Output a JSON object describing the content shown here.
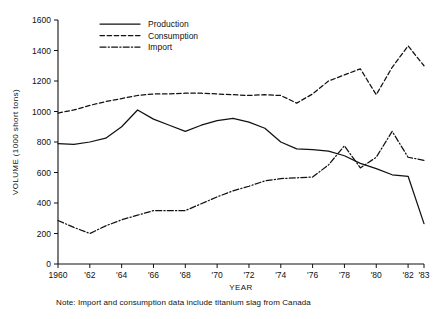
{
  "chart_data": {
    "type": "line",
    "title": "",
    "xlabel": "YEAR",
    "ylabel": "VOLUME (1000 short tons)",
    "xlim": [
      1960,
      1983
    ],
    "ylim": [
      0,
      1600
    ],
    "grid": false,
    "legend_position": "top-left-inside",
    "y_ticks": [
      0,
      200,
      400,
      600,
      800,
      1000,
      1200,
      1400,
      1600
    ],
    "y_tick_labels": [
      "0",
      "200",
      "400",
      "600",
      "800",
      "1000",
      "1200",
      "1400",
      "1600"
    ],
    "x_ticks": [
      1960,
      1962,
      1964,
      1966,
      1968,
      1970,
      1972,
      1974,
      1976,
      1978,
      1980,
      1982,
      1983
    ],
    "x_tick_labels": [
      "1960",
      "'62",
      "'64",
      "'66",
      "'68",
      "'70",
      "'72",
      "'74",
      "'76",
      "'78",
      "'80",
      "'82",
      "'83"
    ],
    "x": [
      1960,
      1961,
      1962,
      1963,
      1964,
      1965,
      1966,
      1967,
      1968,
      1969,
      1970,
      1971,
      1972,
      1973,
      1974,
      1975,
      1976,
      1977,
      1978,
      1979,
      1980,
      1981,
      1982,
      1983
    ],
    "series": [
      {
        "name": "Production",
        "style": "solid",
        "values": [
          790,
          785,
          800,
          825,
          900,
          1010,
          950,
          910,
          870,
          910,
          940,
          955,
          930,
          890,
          800,
          755,
          750,
          740,
          710,
          660,
          625,
          585,
          575,
          265
        ]
      },
      {
        "name": "Consumption",
        "style": "dashed",
        "values": [
          990,
          1010,
          1040,
          1065,
          1085,
          1105,
          1115,
          1115,
          1120,
          1120,
          1115,
          1110,
          1105,
          1110,
          1105,
          1055,
          1115,
          1200,
          1240,
          1280,
          1110,
          1290,
          1430,
          1300
        ]
      },
      {
        "name": "Import",
        "style": "dash-dot",
        "values": [
          285,
          240,
          200,
          250,
          290,
          320,
          350,
          350,
          350,
          395,
          440,
          480,
          510,
          545,
          560,
          565,
          570,
          650,
          775,
          630,
          700,
          870,
          700,
          680
        ]
      }
    ],
    "note": "Note: Import and consumption data include titanium slag from Canada"
  },
  "legend": {
    "items": [
      {
        "label": "Production",
        "style": "solid"
      },
      {
        "label": "Consumption",
        "style": "dashed"
      },
      {
        "label": "Import",
        "style": "dash-dot"
      }
    ]
  },
  "axes": {
    "x_title": "YEAR",
    "y_title": "VOLUME (1000 short tons)"
  },
  "footer": {
    "note": "Note: Import and consumption data include titanium slag from Canada"
  }
}
